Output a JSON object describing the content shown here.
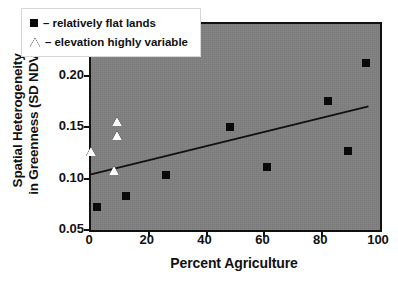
{
  "chart_data": {
    "type": "scatter",
    "title": "",
    "xlabel": "Percent Agriculture",
    "ylabel_line1": "Spatial Heterogeneity",
    "ylabel_line2": "in Greenness (SD NDVI)",
    "xlim": [
      0,
      100
    ],
    "ylim": [
      0.05,
      0.25
    ],
    "xticks": [
      0,
      20,
      40,
      60,
      80,
      100
    ],
    "yticks": [
      0.05,
      0.1,
      0.15,
      0.2,
      0.25
    ],
    "xtick_labels": [
      "0",
      "20",
      "40",
      "60",
      "80",
      "100"
    ],
    "ytick_labels": [
      "0.05",
      "0.10",
      "0.15",
      "0.20",
      "0.25"
    ],
    "grid": false,
    "legend_position": "top-left",
    "plot_background": "#808080",
    "series": [
      {
        "name": "relatively flat lands",
        "marker": "filled-square",
        "color": "#0a0a0a",
        "points": [
          {
            "x": 2,
            "y": 0.072
          },
          {
            "x": 12,
            "y": 0.083
          },
          {
            "x": 26,
            "y": 0.103
          },
          {
            "x": 48,
            "y": 0.15
          },
          {
            "x": 61,
            "y": 0.111
          },
          {
            "x": 82,
            "y": 0.175
          },
          {
            "x": 89,
            "y": 0.127
          },
          {
            "x": 95,
            "y": 0.212
          }
        ]
      },
      {
        "name": "elevation highly variable",
        "marker": "open-triangle",
        "color": "#ffffff",
        "points": [
          {
            "x": 0,
            "y": 0.126
          },
          {
            "x": 8,
            "y": 0.107
          },
          {
            "x": 9,
            "y": 0.141
          },
          {
            "x": 9,
            "y": 0.155
          }
        ]
      }
    ],
    "trendline": {
      "x0": 0,
      "y0": 0.104,
      "x1": 96,
      "y1": 0.17,
      "color": "#111111"
    }
  },
  "legend": {
    "items": [
      {
        "marker": "filled-square",
        "dash": "–",
        "label": "relatively flat lands"
      },
      {
        "marker": "open-triangle",
        "dash": "–",
        "label": "elevation highly variable"
      }
    ]
  }
}
